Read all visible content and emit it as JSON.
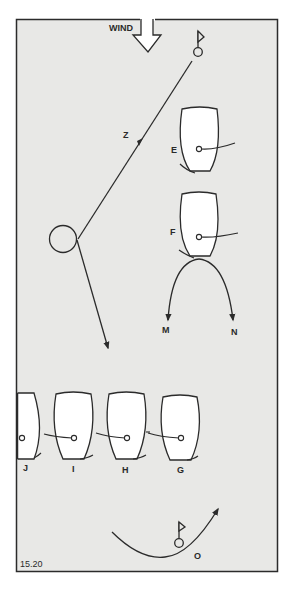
{
  "figure": {
    "number": "15.20",
    "background": "#e8e8e6",
    "stroke": "#2b2b2b"
  },
  "wind": {
    "label": "WIND",
    "direction": "down"
  },
  "marks": [
    {
      "name": "windward-mark",
      "x": 198,
      "y": 52
    },
    {
      "name": "leeward-mark",
      "x": 179,
      "y": 543,
      "label": "O"
    }
  ],
  "course": {
    "label": "Z",
    "description": "Line from windward mark down-left to a rounding circle, then down-right"
  },
  "boats": [
    {
      "id": "E",
      "label": "E",
      "x": 199,
      "y": 140
    },
    {
      "id": "F",
      "label": "F",
      "x": 199,
      "y": 226
    },
    {
      "id": "J",
      "label": "J",
      "x": 22,
      "y": 428
    },
    {
      "id": "I",
      "label": "I",
      "x": 74,
      "y": 428
    },
    {
      "id": "H",
      "label": "H",
      "x": 127,
      "y": 428
    },
    {
      "id": "G",
      "label": "G",
      "x": 181,
      "y": 428
    }
  ],
  "paths": [
    {
      "label": "M",
      "description": "Curve from boat F bow bearing away to the left"
    },
    {
      "label": "N",
      "description": "Curve from boat F bow bearing away to the right"
    }
  ]
}
